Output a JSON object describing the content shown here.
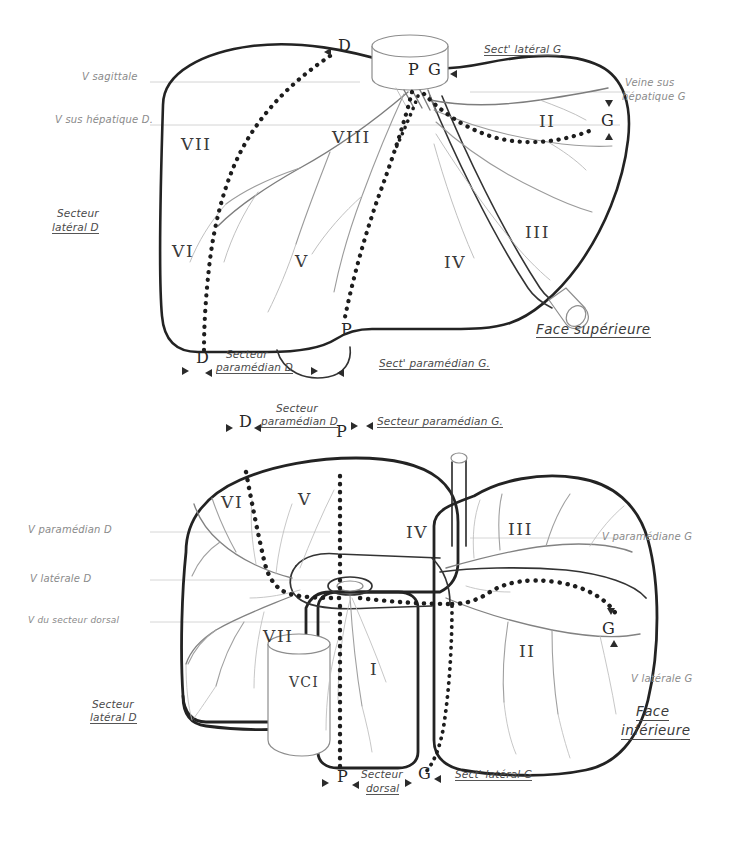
{
  "plate": {
    "title": "Segmentation hépatique de Couinaud",
    "background_color": "#ffffff",
    "ink_color": "#2b2b2b",
    "faint_ink_color": "#9a9a9a"
  },
  "figures": [
    {
      "id": "superior",
      "caption": "Face supérieure",
      "caption_line1": "Face supérieure",
      "segments": [
        {
          "label": "VII",
          "x": 181,
          "y": 145
        },
        {
          "label": "VIII",
          "x": 332,
          "y": 138
        },
        {
          "label": "VI",
          "x": 172,
          "y": 252
        },
        {
          "label": "V",
          "x": 295,
          "y": 262
        },
        {
          "label": "IV",
          "x": 444,
          "y": 263
        },
        {
          "label": "III",
          "x": 525,
          "y": 233
        },
        {
          "label": "II",
          "x": 539,
          "y": 122
        }
      ],
      "markers": [
        {
          "label": "D",
          "x": 338,
          "y": 48
        },
        {
          "label": "P",
          "x": 412,
          "y": 72
        },
        {
          "label": "G",
          "x": 430,
          "y": 72
        },
        {
          "label": "G",
          "x": 604,
          "y": 122
        },
        {
          "label": "P",
          "x": 343,
          "y": 330
        },
        {
          "label": "D",
          "x": 199,
          "y": 358
        }
      ],
      "annotations": [
        {
          "text": "V sagittale",
          "x": 82,
          "y": 78,
          "style": "faint"
        },
        {
          "text": "V sus hépatique D.",
          "x": 55,
          "y": 121,
          "style": "faint"
        },
        {
          "text": "Sect' latéral G",
          "x": 484,
          "y": 50,
          "style": "underline"
        },
        {
          "text": "Veine sus",
          "x": 625,
          "y": 84,
          "style": "faint"
        },
        {
          "text": "hépatique G",
          "x": 622,
          "y": 98,
          "style": "faint"
        },
        {
          "text": "Secteur",
          "x": 57,
          "y": 214,
          "style": "plain"
        },
        {
          "text": "latéral D",
          "x": 52,
          "y": 228,
          "style": "underline"
        },
        {
          "text": "Secteur",
          "x": 226,
          "y": 355,
          "style": "plain"
        },
        {
          "text": "paramédian D",
          "x": 216,
          "y": 368,
          "style": "underline"
        },
        {
          "text": "Sect' paramédian G.",
          "x": 379,
          "y": 364,
          "style": "underline"
        },
        {
          "text": "Face supérieure",
          "x": 536,
          "y": 330,
          "style": "face"
        }
      ]
    },
    {
      "id": "inferior",
      "caption": "Face inférieure",
      "caption_line1": "Face",
      "caption_line2": "inférieure",
      "segments": [
        {
          "label": "VI",
          "x": 221,
          "y": 503
        },
        {
          "label": "V",
          "x": 298,
          "y": 500
        },
        {
          "label": "IV",
          "x": 406,
          "y": 533
        },
        {
          "label": "III",
          "x": 508,
          "y": 530
        },
        {
          "label": "VII",
          "x": 265,
          "y": 637
        },
        {
          "label": "VCI",
          "x": 295,
          "y": 682
        },
        {
          "label": "I",
          "x": 372,
          "y": 670
        },
        {
          "label": "II",
          "x": 519,
          "y": 652
        }
      ],
      "markers": [
        {
          "label": "D",
          "x": 242,
          "y": 424
        },
        {
          "label": "P",
          "x": 339,
          "y": 432
        },
        {
          "label": "G",
          "x": 606,
          "y": 629
        },
        {
          "label": "P",
          "x": 340,
          "y": 777
        },
        {
          "label": "G",
          "x": 421,
          "y": 773
        }
      ],
      "annotations": [
        {
          "text": "Secteur",
          "x": 276,
          "y": 409,
          "style": "plain"
        },
        {
          "text": "paramédian D",
          "x": 261,
          "y": 422,
          "style": "underline"
        },
        {
          "text": "Secteur paramédian G.",
          "x": 377,
          "y": 422,
          "style": "underline"
        },
        {
          "text": "V paramédian D",
          "x": 28,
          "y": 531,
          "style": "faint"
        },
        {
          "text": "V latérale D",
          "x": 30,
          "y": 580,
          "style": "faint"
        },
        {
          "text": "V du secteur dorsal",
          "x": 28,
          "y": 622,
          "style": "faint"
        },
        {
          "text": "V paramédiane G",
          "x": 602,
          "y": 538,
          "style": "faint"
        },
        {
          "text": "V latérale G",
          "x": 631,
          "y": 680,
          "style": "faint"
        },
        {
          "text": "Secteur",
          "x": 92,
          "y": 705,
          "style": "plain"
        },
        {
          "text": "latéral D",
          "x": 90,
          "y": 718,
          "style": "underline"
        },
        {
          "text": "Secteur",
          "x": 361,
          "y": 775,
          "style": "plain"
        },
        {
          "text": "dorsal",
          "x": 366,
          "y": 789,
          "style": "underline"
        },
        {
          "text": "Sect' latéral G",
          "x": 455,
          "y": 775,
          "style": "underline"
        },
        {
          "text": "Face",
          "x": 636,
          "y": 710,
          "style": "face"
        },
        {
          "text": "inférieure",
          "x": 621,
          "y": 729,
          "style": "face"
        }
      ]
    }
  ]
}
